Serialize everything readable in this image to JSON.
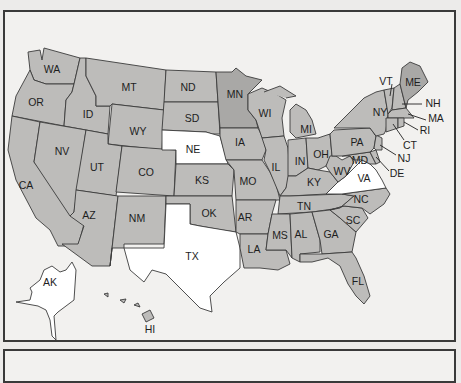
{
  "map": {
    "type": "us-states-choropleth",
    "colors": {
      "default_fill": "#bdbcba",
      "dark_fill": "#a9a8a6",
      "unshaded_fill": "#ffffff",
      "border": "#3b3b3b",
      "frame": "#3a3a3a",
      "background": "#f2f1ef"
    },
    "unshaded_states": [
      "NE",
      "TX",
      "VA",
      "AK"
    ],
    "dark_states": [
      "MN",
      "ME"
    ],
    "states": {
      "WA": "WA",
      "OR": "OR",
      "CA": "CA",
      "ID": "ID",
      "NV": "NV",
      "MT": "MT",
      "WY": "WY",
      "UT": "UT",
      "AZ": "AZ",
      "CO": "CO",
      "NM": "NM",
      "ND": "ND",
      "SD": "SD",
      "NE": "NE",
      "KS": "KS",
      "OK": "OK",
      "TX": "TX",
      "MN": "MN",
      "IA": "IA",
      "MO": "MO",
      "AR": "AR",
      "LA": "LA",
      "WI": "WI",
      "IL": "IL",
      "MI": "MI",
      "IN": "IN",
      "OH": "OH",
      "KY": "KY",
      "TN": "TN",
      "MS": "MS",
      "AL": "AL",
      "GA": "GA",
      "FL": "FL",
      "SC": "SC",
      "NC": "NC",
      "VA": "VA",
      "WV": "WV",
      "PA": "PA",
      "NY": "NY",
      "VT": "VT",
      "NH": "NH",
      "ME": "ME",
      "MA": "MA",
      "RI": "RI",
      "CT": "CT",
      "NJ": "NJ",
      "DE": "DE",
      "MD": "MD",
      "AK": "AK",
      "HI": "HI"
    }
  }
}
